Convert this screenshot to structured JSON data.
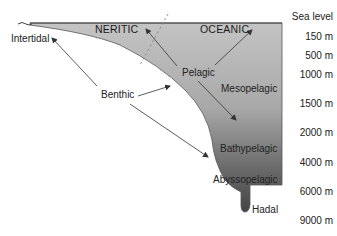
{
  "diagram": {
    "zones": {
      "neritic": "NERITIC",
      "oceanic": "OCEANIC"
    },
    "labels": {
      "intertidal": "Intertidal",
      "benthic": "Benthic",
      "pelagic": "Pelagic",
      "mesopelagic": "Mesopelagic",
      "bathypelagic": "Bathypelagic",
      "abyssopelagic": "Abyssopelagic",
      "hadal": "Hadal"
    },
    "depths": [
      "Sea level",
      "150 m",
      "500 m",
      "1000 m",
      "1500 m",
      "2000 m",
      "4000 m",
      "6000 m",
      "9000 m"
    ],
    "colors": {
      "water_top": "#bdbdbd",
      "water_bottom": "#4a4a4a",
      "arrow": "#333333",
      "text": "#222222"
    }
  }
}
